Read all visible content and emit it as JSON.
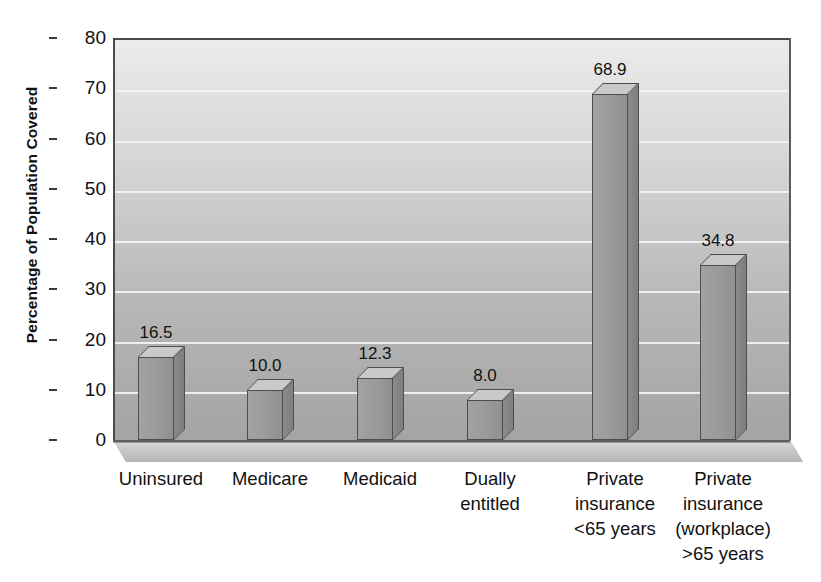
{
  "chart_data": {
    "type": "bar",
    "title": "",
    "xlabel": "",
    "ylabel": "Percentage of Population Covered",
    "ylim": [
      0,
      80
    ],
    "y_ticks": [
      0,
      10,
      20,
      30,
      40,
      50,
      60,
      70,
      80
    ],
    "grid": true,
    "legend": "none",
    "style": "3d-bar",
    "categories": [
      "Uninsured",
      "Medicare",
      "Medicaid",
      "Dually entitled",
      "Private insurance <65 years",
      "Private insurance (workplace) >65 years"
    ],
    "category_lines": [
      [
        "Uninsured"
      ],
      [
        "Medicare"
      ],
      [
        "Medicaid"
      ],
      [
        "Dually",
        "entitled"
      ],
      [
        "Private",
        "insurance",
        "<65 years"
      ],
      [
        "Private",
        "insurance",
        "(workplace)",
        ">65 years"
      ]
    ],
    "values": [
      16.5,
      10.0,
      12.3,
      8.0,
      68.9,
      34.8
    ],
    "value_labels": [
      "16.5",
      "10.0",
      "12.3",
      "8.0",
      "68.9",
      "34.8"
    ]
  },
  "axis": {
    "y_title": "Percentage of Population Covered",
    "y_tick_labels": [
      "80",
      "70",
      "60",
      "50",
      "40",
      "30",
      "20",
      "10",
      "0"
    ]
  },
  "colors": {
    "bar_front": "#9a9a9a",
    "bar_top": "#c9c9c9",
    "bar_side": "#858585",
    "bar_outline": "#4d4d4d",
    "gridline": "#f2f2f2",
    "plot_bg_top": "#ececec",
    "plot_bg_bottom": "#a4a4a4",
    "text": "#111111",
    "page_bg": "#ffffff"
  }
}
